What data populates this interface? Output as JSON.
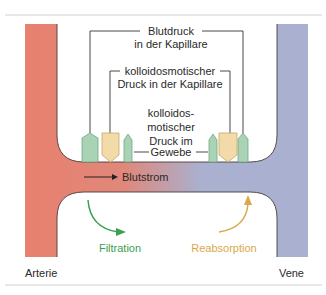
{
  "diagram": {
    "labels": {
      "blood_pressure_line1": "Blutdruck",
      "blood_pressure_line2": "in der Kapillare",
      "oncotic_capillary_line1": "kolloidosmotischer",
      "oncotic_capillary_line2": "Druck in der Kapillare",
      "oncotic_tissue_line1": "kolloidos-",
      "oncotic_tissue_line2": "motischer",
      "oncotic_tissue_line3": "Druck im",
      "oncotic_tissue_line4": "Gewebe",
      "blood_flow": "Blutstrom",
      "filtration": "Filtration",
      "reabsorption": "Reabsorption",
      "artery": "Arterie",
      "vein": "Vene"
    },
    "colors": {
      "artery": "#e8806e",
      "vein": "#a9b0d0",
      "blood_pressure_glyph": "#a9d3b4",
      "oncotic_glyph": "#f2dba8",
      "filtration": "#3aa04f",
      "reabsorption": "#d9a84a",
      "rule": "#cccccc",
      "text": "#2a2a2a"
    }
  }
}
